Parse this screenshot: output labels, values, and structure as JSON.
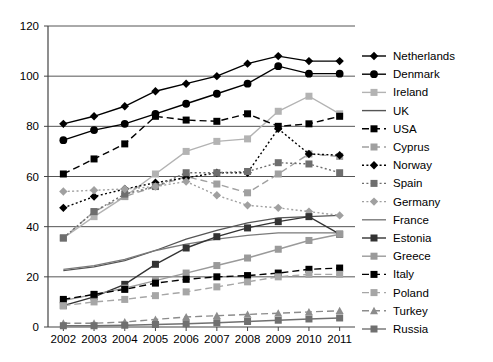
{
  "chart_data": {
    "type": "line",
    "title": "",
    "subtitle": "",
    "xlabel": "",
    "ylabel": "",
    "x": [
      2002,
      2003,
      2004,
      2005,
      2006,
      2007,
      2008,
      2009,
      2010,
      2011
    ],
    "xtick_labels": [
      "2002",
      "2003",
      "2004",
      "2005",
      "2006",
      "2007",
      "2008",
      "2009",
      "2010",
      "2011"
    ],
    "ytick_labels": [
      "0",
      "20",
      "40",
      "60",
      "80",
      "100",
      "120"
    ],
    "yticks": [
      0,
      20,
      40,
      60,
      80,
      100,
      120
    ],
    "ylim": [
      0,
      120
    ],
    "grid": "horizontal",
    "legend_position": "right",
    "series": [
      {
        "name": "Netherlands",
        "marker": "diamond",
        "dash": "solid",
        "color": "#000000",
        "values": [
          81,
          84,
          88,
          94,
          97,
          100,
          105,
          108,
          106,
          106
        ]
      },
      {
        "name": "Denmark",
        "marker": "circle",
        "dash": "solid",
        "color": "#000000",
        "values": [
          74.5,
          78.5,
          81,
          85,
          89,
          93,
          97,
          104,
          101,
          101
        ]
      },
      {
        "name": "Ireland",
        "marker": "square",
        "dash": "solid",
        "color": "#b3b3b3",
        "values": [
          35.5,
          44,
          52,
          61,
          70,
          74,
          75,
          86,
          92,
          85
        ]
      },
      {
        "name": "UK",
        "marker": "none",
        "dash": "solid",
        "color": "#555555",
        "values": [
          22.5,
          24,
          26.5,
          30.5,
          35,
          38.5,
          41.5,
          43.5,
          44,
          44.5
        ]
      },
      {
        "name": "USA",
        "marker": "square",
        "dash": "dashed",
        "color": "#000000",
        "values": [
          61,
          67,
          73,
          84,
          82.5,
          82,
          85,
          80,
          81,
          84
        ]
      },
      {
        "name": "Cyprus",
        "marker": "square",
        "dash": "dashed",
        "color": "#a0a0a0",
        "values": [
          35.5,
          46,
          52,
          56,
          60,
          57,
          53.5,
          61,
          69,
          68
        ]
      },
      {
        "name": "Norway",
        "marker": "diamond",
        "dash": "dotted",
        "color": "#000000",
        "values": [
          47.5,
          52,
          55,
          57.5,
          59.5,
          61.5,
          61.5,
          79,
          69,
          68.5
        ]
      },
      {
        "name": "Spain",
        "marker": "square",
        "dash": "dotted",
        "color": "#6e6e6e",
        "values": [
          35.5,
          46,
          53,
          56,
          61.5,
          61.5,
          62,
          65.5,
          65,
          61.5
        ]
      },
      {
        "name": "Germany",
        "marker": "diamond",
        "dash": "dotted",
        "color": "#a0a0a0",
        "values": [
          54,
          54.5,
          55,
          56,
          58,
          52.5,
          48.5,
          47.5,
          46,
          44.5
        ]
      },
      {
        "name": "France",
        "marker": "none",
        "dash": "solid",
        "color": "#7a7a7a",
        "values": [
          23,
          24.5,
          27,
          30.5,
          33,
          35,
          36.5,
          37.5,
          37.5,
          37.5
        ]
      },
      {
        "name": "Estonia",
        "marker": "square",
        "dash": "solid",
        "color": "#333333",
        "values": [
          8.5,
          12,
          17,
          25,
          31.5,
          36,
          39.5,
          42,
          44,
          37
        ]
      },
      {
        "name": "Greece",
        "marker": "square",
        "dash": "solid",
        "color": "#9a9a9a",
        "values": [
          10.5,
          13,
          15.5,
          18.5,
          21.5,
          24.5,
          27.5,
          31,
          34.5,
          37
        ]
      },
      {
        "name": "Italy",
        "marker": "square",
        "dash": "dashed",
        "color": "#000000",
        "values": [
          11,
          13,
          15,
          17.5,
          19,
          20,
          20.5,
          21.5,
          23,
          23.5
        ]
      },
      {
        "name": "Poland",
        "marker": "square",
        "dash": "dashed",
        "color": "#a6a6a6",
        "values": [
          8.5,
          10,
          11,
          12.5,
          14,
          16,
          18,
          20,
          21,
          21
        ]
      },
      {
        "name": "Turkey",
        "marker": "triangle",
        "dash": "dashed",
        "color": "#8c8c8c",
        "values": [
          1.5,
          1.5,
          2,
          3,
          4,
          4.5,
          5,
          5.5,
          6,
          6.5
        ]
      },
      {
        "name": "Russia",
        "marker": "square",
        "dash": "solid",
        "color": "#707070",
        "values": [
          0.5,
          0.5,
          0.7,
          1,
          1.3,
          1.7,
          2.2,
          2.7,
          3.2,
          3.6
        ]
      }
    ]
  },
  "legend": {
    "items": [
      "Netherlands",
      "Denmark",
      "Ireland",
      "UK",
      "USA",
      "Cyprus",
      "Norway",
      "Spain",
      "Germany",
      "France",
      "Estonia",
      "Greece",
      "Italy",
      "Poland",
      "Turkey",
      "Russia"
    ]
  },
  "axes": {
    "y_labels": [
      "120",
      "100",
      "80",
      "60",
      "40",
      "20",
      "0"
    ],
    "x_labels": [
      "2002",
      "2003",
      "2004",
      "2005",
      "2006",
      "2007",
      "2008",
      "2009",
      "2010",
      "2011"
    ]
  }
}
